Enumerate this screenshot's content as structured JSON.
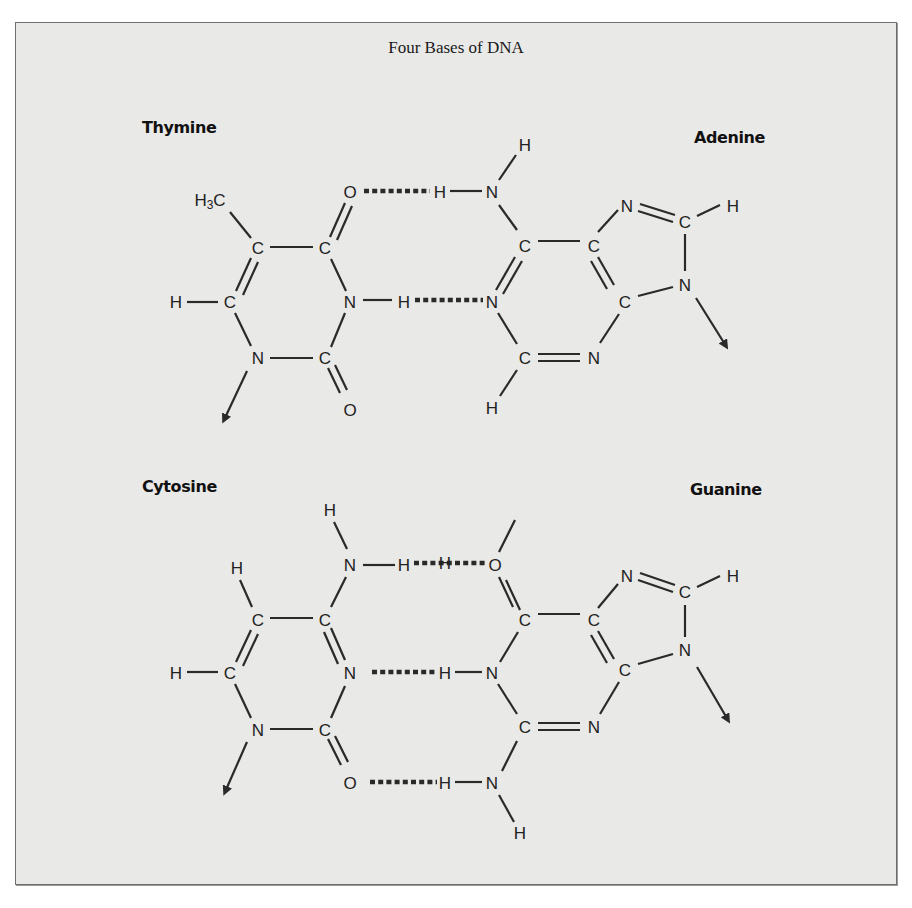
{
  "figure": {
    "title": "Four Bases of DNA",
    "background_color": "#e9e9e8",
    "border_color": "#6f6f6f"
  },
  "bases": {
    "thymine": {
      "name": "Thymine"
    },
    "adenine": {
      "name": "Adenine"
    },
    "cytosine": {
      "name": "Cytosine"
    },
    "guanine": {
      "name": "Guanine"
    }
  },
  "atoms": {
    "thymine": [
      "H3C",
      "C",
      "C",
      "O",
      "H",
      "C",
      "N",
      "N",
      "C",
      "O"
    ],
    "adenine": [
      "H",
      "N",
      "H",
      "C",
      "C",
      "N",
      "C",
      "H",
      "N",
      "C",
      "N",
      "C",
      "N",
      "H"
    ],
    "cytosine": [
      "H",
      "N",
      "H",
      "H",
      "C",
      "C",
      "H",
      "C",
      "N",
      "N",
      "C",
      "O"
    ],
    "guanine": [
      "O",
      "C",
      "C",
      "N",
      "C",
      "H",
      "N",
      "C",
      "H",
      "N",
      "C",
      "N",
      "H",
      "N",
      "H"
    ]
  },
  "pairs": [
    {
      "left": "Thymine",
      "right": "Adenine",
      "hydrogen_bonds": 2
    },
    {
      "left": "Cytosine",
      "right": "Guanine",
      "hydrogen_bonds": 3
    }
  ]
}
